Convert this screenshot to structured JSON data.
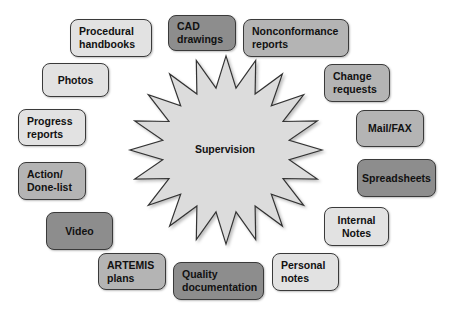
{
  "diagram": {
    "center": {
      "label": "Supervision",
      "shape": "starburst",
      "fill": "#dcdcdc"
    },
    "colors": {
      "light": "#e2e2e2",
      "medium": "#b4b4b4",
      "dark": "#8d8d8d",
      "border": "#3a3a3a"
    },
    "nodes": [
      {
        "id": "procedural-handbooks",
        "label": "Procedural\nhandbooks",
        "shade": "light"
      },
      {
        "id": "cad-drawings",
        "label": "CAD\ndrawings",
        "shade": "dark"
      },
      {
        "id": "nonconformance-reports",
        "label": "Nonconformance\nreports",
        "shade": "medium"
      },
      {
        "id": "photos",
        "label": "Photos",
        "shade": "light"
      },
      {
        "id": "change-requests",
        "label": "Change\nrequests",
        "shade": "medium"
      },
      {
        "id": "progress-reports",
        "label": "Progress\nreports",
        "shade": "light"
      },
      {
        "id": "mail-fax",
        "label": "Mail/FAX",
        "shade": "medium"
      },
      {
        "id": "action-done-list",
        "label": "Action/\nDone-list",
        "shade": "medium"
      },
      {
        "id": "spreadsheets",
        "label": "Spreadsheets",
        "shade": "dark"
      },
      {
        "id": "video",
        "label": "Video",
        "shade": "dark"
      },
      {
        "id": "internal-notes",
        "label": "Internal\nNotes",
        "shade": "light"
      },
      {
        "id": "artemis-plans",
        "label": "ARTEMIS\nplans",
        "shade": "medium"
      },
      {
        "id": "quality-documentation",
        "label": "Quality\ndocumentation",
        "shade": "dark"
      },
      {
        "id": "personal-notes",
        "label": "Personal\nnotes",
        "shade": "light"
      }
    ]
  }
}
